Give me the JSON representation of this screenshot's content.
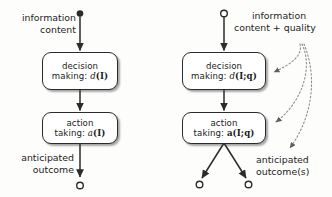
{
  "figure": {
    "stroke_color": "#2b2b2b",
    "dotted_color": "#8a8a8a",
    "background": "#fdfdfc"
  },
  "panels": [
    {
      "id": "left",
      "name": "content-only-pipeline",
      "input_label": "information\ncontent",
      "input_label_line1": "information",
      "input_label_line2": "content",
      "output_label_line1": "anticipated",
      "output_label_line2": "outcome",
      "nodes": [
        {
          "name": "decision-making",
          "line1": "decision",
          "line2_prefix": "making: ",
          "line2_fn": "d",
          "line2_args": "(I)"
        },
        {
          "name": "action-taking",
          "line1": "action",
          "line2_prefix": "taking: ",
          "line2_fn": "a",
          "line2_args": "(I)"
        }
      ],
      "start_marker": "filled-circle",
      "end_marker": "open-circle",
      "outcome_count": 1
    },
    {
      "id": "right",
      "name": "content-plus-quality-pipeline",
      "input_label_line1": "information",
      "input_label_line2": "content + quality",
      "output_label_line1": "anticipated",
      "output_label_line2": "outcome(s)",
      "nodes": [
        {
          "name": "decision-making",
          "line1": "decision",
          "line2_prefix": "making: ",
          "line2_fn": "d",
          "line2_args": "(I;q)"
        },
        {
          "name": "action-taking",
          "line1": "action",
          "line2_prefix": "taking: ",
          "line2_fn": "a",
          "line2_args": "(I;q)"
        }
      ],
      "start_marker": "open-circle",
      "end_marker": "open-circle",
      "outcome_count": 2,
      "quality_influence_targets": [
        "decision-making",
        "action-taking",
        "anticipated-outcomes"
      ]
    }
  ]
}
